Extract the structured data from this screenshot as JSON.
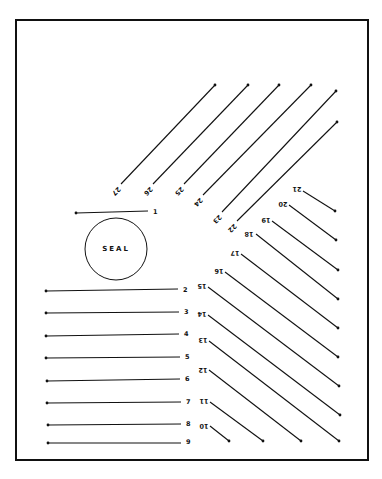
{
  "diagram": {
    "type": "numbered line-segment layout sheet",
    "frame": {
      "x1": 16,
      "y1": 20,
      "x2": 368,
      "y2": 460
    },
    "seal": {
      "label": "SEAL",
      "cx": 116,
      "cy": 249,
      "r": 31
    },
    "colors": {
      "ink": "#111111",
      "background": "#ffffff"
    },
    "segments": [
      {
        "n": "1",
        "x1": 76,
        "y1": 213,
        "x2": 148,
        "y2": 211,
        "lx": 153,
        "ly": 212,
        "rot": 0
      },
      {
        "n": "2",
        "x1": 46,
        "y1": 291,
        "x2": 178,
        "y2": 289,
        "lx": 183,
        "ly": 290,
        "rot": 0
      },
      {
        "n": "3",
        "x1": 46,
        "y1": 313,
        "x2": 179,
        "y2": 312,
        "lx": 184,
        "ly": 312,
        "rot": 0
      },
      {
        "n": "4",
        "x1": 46,
        "y1": 336,
        "x2": 179,
        "y2": 334,
        "lx": 184,
        "ly": 334,
        "rot": 0
      },
      {
        "n": "5",
        "x1": 46,
        "y1": 358,
        "x2": 180,
        "y2": 357,
        "lx": 185,
        "ly": 357,
        "rot": 0
      },
      {
        "n": "6",
        "x1": 47,
        "y1": 381,
        "x2": 180,
        "y2": 379,
        "lx": 185,
        "ly": 379,
        "rot": 0
      },
      {
        "n": "7",
        "x1": 47,
        "y1": 403,
        "x2": 181,
        "y2": 402,
        "lx": 186,
        "ly": 402,
        "rot": 0
      },
      {
        "n": "8",
        "x1": 48,
        "y1": 425,
        "x2": 181,
        "y2": 424,
        "lx": 186,
        "ly": 424,
        "rot": 0
      },
      {
        "n": "9",
        "x1": 48,
        "y1": 443,
        "x2": 181,
        "y2": 443,
        "lx": 186,
        "ly": 442,
        "rot": 0
      },
      {
        "n": "10",
        "x1": 210,
        "y1": 426,
        "x2": 229,
        "y2": 441,
        "lx": 204,
        "ly": 426,
        "rot": 180
      },
      {
        "n": "11",
        "x1": 210,
        "y1": 402,
        "x2": 263,
        "y2": 441,
        "lx": 204,
        "ly": 401,
        "rot": 180
      },
      {
        "n": "12",
        "x1": 209,
        "y1": 370,
        "x2": 301,
        "y2": 441,
        "lx": 203,
        "ly": 370,
        "rot": 180
      },
      {
        "n": "13",
        "x1": 209,
        "y1": 341,
        "x2": 339,
        "y2": 441,
        "lx": 203,
        "ly": 340,
        "rot": 180
      },
      {
        "n": "14",
        "x1": 208,
        "y1": 315,
        "x2": 340,
        "y2": 415,
        "lx": 202,
        "ly": 314,
        "rot": 180
      },
      {
        "n": "15",
        "x1": 208,
        "y1": 287,
        "x2": 339,
        "y2": 386,
        "lx": 202,
        "ly": 286,
        "rot": 180
      },
      {
        "n": "16",
        "x1": 225,
        "y1": 272,
        "x2": 338,
        "y2": 357,
        "lx": 219,
        "ly": 271,
        "rot": 180
      },
      {
        "n": "17",
        "x1": 241,
        "y1": 254,
        "x2": 338,
        "y2": 328,
        "lx": 235,
        "ly": 253,
        "rot": 180
      },
      {
        "n": "18",
        "x1": 256,
        "y1": 234,
        "x2": 338,
        "y2": 299,
        "lx": 249,
        "ly": 234,
        "rot": 180
      },
      {
        "n": "19",
        "x1": 272,
        "y1": 221,
        "x2": 338,
        "y2": 270,
        "lx": 266,
        "ly": 220,
        "rot": 180
      },
      {
        "n": "20",
        "x1": 289,
        "y1": 205,
        "x2": 336,
        "y2": 240,
        "lx": 283,
        "ly": 204,
        "rot": 180
      },
      {
        "n": "21",
        "x1": 303,
        "y1": 191,
        "x2": 335,
        "y2": 211,
        "lx": 297,
        "ly": 189,
        "rot": 180
      },
      {
        "n": "22",
        "x1": 237,
        "y1": 221,
        "x2": 337,
        "y2": 122,
        "lx": 232,
        "ly": 228,
        "rot": 135
      },
      {
        "n": "23",
        "x1": 222,
        "y1": 212,
        "x2": 336,
        "y2": 91,
        "lx": 217,
        "ly": 219,
        "rot": 135
      },
      {
        "n": "24",
        "x1": 203,
        "y1": 195,
        "x2": 311,
        "y2": 85,
        "lx": 198,
        "ly": 202,
        "rot": 135
      },
      {
        "n": "25",
        "x1": 184,
        "y1": 184,
        "x2": 279,
        "y2": 85,
        "lx": 179,
        "ly": 191,
        "rot": 135
      },
      {
        "n": "26",
        "x1": 153,
        "y1": 184,
        "x2": 248,
        "y2": 85,
        "lx": 148,
        "ly": 191,
        "rot": 135
      },
      {
        "n": "27",
        "x1": 121,
        "y1": 184,
        "x2": 215,
        "y2": 85,
        "lx": 116,
        "ly": 191,
        "rot": 135
      }
    ]
  }
}
